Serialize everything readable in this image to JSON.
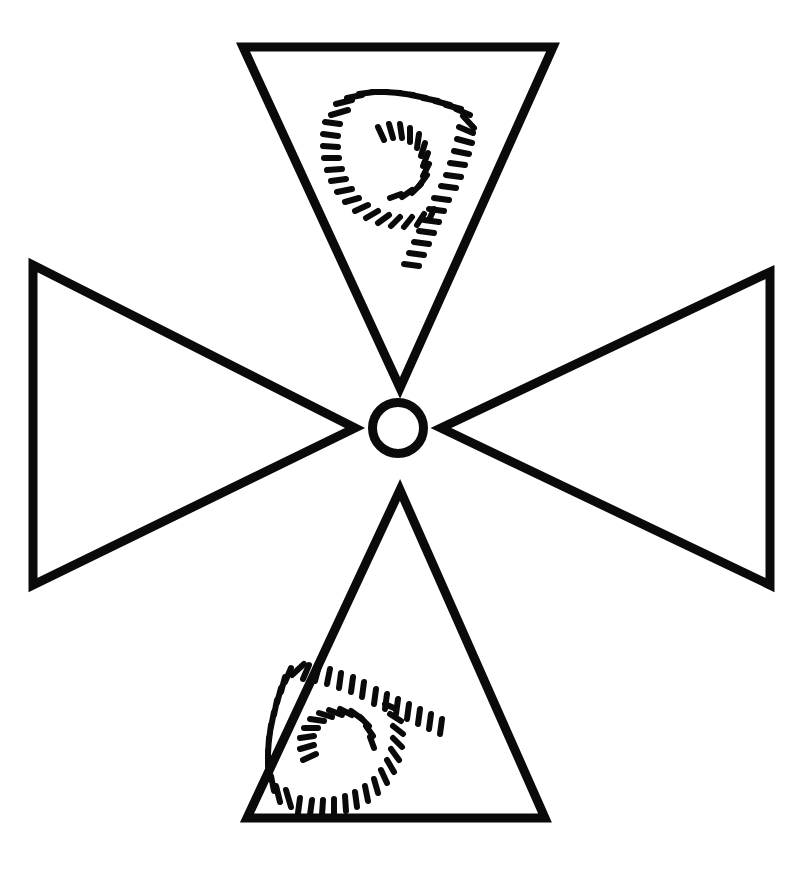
{
  "canvas": {
    "width": 808,
    "height": 895,
    "background_color": "#ffffff",
    "ink_color": "#0a0a0a",
    "title": "Four-triangle cross figure with hatched digits"
  },
  "figure": {
    "name": "cross-of-triangles",
    "stroke_width": 9,
    "center": {
      "x": 398,
      "y": 428
    }
  },
  "center_ring": {
    "name": "center-circle",
    "cx": 398,
    "cy": 428,
    "outer_radius": 30,
    "stroke_width": 9,
    "fill": "none"
  },
  "triangles": [
    {
      "id": "top",
      "name": "triangle-top",
      "orientation": "pointing-down",
      "points": "243,47 553,47 400,388",
      "contains_digit": true,
      "digit": "9",
      "digit_style": "hatched",
      "digit_rotation_deg": 0
    },
    {
      "id": "right",
      "name": "triangle-right",
      "orientation": "pointing-left",
      "points": "770,272 770,585 441,428",
      "contains_digit": true,
      "digit": "9",
      "digit_style": "hatched",
      "digit_rotation_deg": -90
    },
    {
      "id": "bottom",
      "name": "triangle-bottom",
      "orientation": "pointing-up",
      "points": "247,818 545,818 400,490",
      "contains_digit": false,
      "digit": "",
      "digit_style": "none",
      "digit_rotation_deg": 0
    },
    {
      "id": "left",
      "name": "triangle-left",
      "orientation": "pointing-right",
      "points": "33,265 33,585 355,428",
      "contains_digit": false,
      "digit": "",
      "digit_style": "none",
      "digit_rotation_deg": 0
    }
  ],
  "hatched_digits": [
    {
      "id": "digit-top",
      "name": "hatched-digit-top",
      "value": "9",
      "in_triangle": "top",
      "bounding_box": {
        "x": 318,
        "y": 92,
        "width": 160,
        "height": 175
      },
      "dash_count": 62,
      "dash_length": 17,
      "dash_thickness": 6
    },
    {
      "id": "digit-right",
      "name": "hatched-digit-right",
      "value": "9",
      "in_triangle": "right",
      "bounding_box": {
        "x": 573,
        "y": 345,
        "width": 165,
        "height": 150
      },
      "dash_count": 62,
      "dash_length": 17,
      "dash_thickness": 6
    }
  ],
  "legend": {
    "digits_shown": [
      "9",
      "9"
    ],
    "empty_triangles": [
      "left",
      "bottom"
    ]
  }
}
